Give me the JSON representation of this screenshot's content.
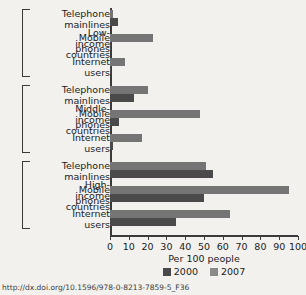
{
  "chart_data": {
    "type": "bar",
    "orientation": "horizontal",
    "title": "",
    "xlabel": "Per 100 people",
    "ylabel": "",
    "xlim": [
      0,
      100
    ],
    "xticks": [
      0,
      10,
      20,
      30,
      40,
      50,
      60,
      70,
      80,
      90,
      100
    ],
    "grid": false,
    "legend_position": "bottom",
    "series": [
      {
        "name": "2000",
        "color": "#4a4a4a"
      },
      {
        "name": "2007",
        "color": "#757575"
      }
    ],
    "groups": [
      {
        "name": "Low-income countries",
        "name_lines": [
          "Low-",
          "income",
          "countries"
        ],
        "categories": [
          {
            "label_lines": [
              "Telephone",
              "mainlines"
            ],
            "label": "Telephone mainlines",
            "values": {
              "2000": 4,
              "2007": 1.5
            }
          },
          {
            "label_lines": [
              "Mobile",
              "phones"
            ],
            "label": "Mobile phones",
            "values": {
              "2000": 0.5,
              "2007": 23
            }
          },
          {
            "label_lines": [
              "Internet",
              "users"
            ],
            "label": "Internet users",
            "values": {
              "2000": 0.4,
              "2007": 8
            }
          }
        ]
      },
      {
        "name": "Middle-income countries",
        "name_lines": [
          "Middle-",
          "income",
          "countries"
        ],
        "categories": [
          {
            "label_lines": [
              "Telephone",
              "mainlines"
            ],
            "label": "Telephone mainlines",
            "values": {
              "2000": 13,
              "2007": 20
            }
          },
          {
            "label_lines": [
              "Mobile",
              "phones"
            ],
            "label": "Mobile phones",
            "values": {
              "2000": 5,
              "2007": 48
            }
          },
          {
            "label_lines": [
              "Internet",
              "users"
            ],
            "label": "Internet users",
            "values": {
              "2000": 1.5,
              "2007": 17
            }
          }
        ]
      },
      {
        "name": "High-income countries",
        "name_lines": [
          "High-",
          "income",
          "countries"
        ],
        "categories": [
          {
            "label_lines": [
              "Telephone",
              "mainlines"
            ],
            "label": "Telephone mainlines",
            "values": {
              "2000": 55,
              "2007": 51
            }
          },
          {
            "label_lines": [
              "Mobile",
              "phones"
            ],
            "label": "Mobile phones",
            "values": {
              "2000": 50,
              "2007": 95
            }
          },
          {
            "label_lines": [
              "Internet",
              "users"
            ],
            "label": "Internet users",
            "values": {
              "2000": 35,
              "2007": 64
            }
          }
        ]
      }
    ]
  },
  "axis": {
    "xlabel": "Per 100 people",
    "ticks": [
      "0",
      "10",
      "20",
      "30",
      "40",
      "50",
      "60",
      "70",
      "80",
      "90",
      "100"
    ]
  },
  "legend": {
    "items": [
      {
        "label": "2000"
      },
      {
        "label": "2007"
      }
    ]
  },
  "source": {
    "text": "http://dx.doi.org/10.1596/978-0-8213-7859-5_F36"
  }
}
